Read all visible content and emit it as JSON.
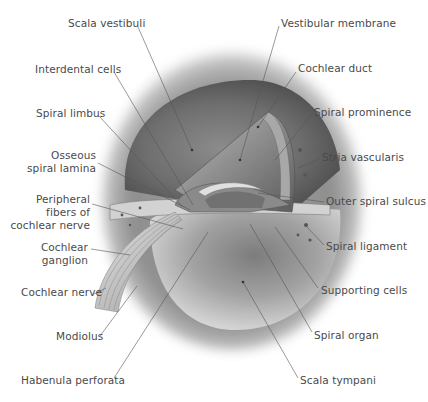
{
  "diagram": {
    "style": "grayscale anatomical illustration",
    "colors": {
      "background": "#ffffff",
      "text": "#4a4a4a",
      "leader_line": "#555555"
    },
    "labels_left": [
      {
        "id": "scala-vestibuli",
        "text": "Scala vestibuli"
      },
      {
        "id": "interdental-cells",
        "text": "Interdental cells"
      },
      {
        "id": "spiral-limbus",
        "text": "Spiral limbus"
      },
      {
        "id": "osseous-spiral-lamina",
        "lines": [
          "Osseous",
          "spiral lamina"
        ]
      },
      {
        "id": "peripheral-fibers",
        "lines": [
          "Peripheral",
          "fibers of",
          "cochlear nerve"
        ]
      },
      {
        "id": "cochlear-ganglion",
        "lines": [
          "Cochlear",
          "ganglion"
        ]
      },
      {
        "id": "cochlear-nerve",
        "text": "Cochlear nerve"
      },
      {
        "id": "modiolus",
        "text": "Modiolus"
      },
      {
        "id": "habenula-perforata",
        "text": "Habenula perforata"
      }
    ],
    "labels_right": [
      {
        "id": "vestibular-membrane",
        "text": "Vestibular membrane"
      },
      {
        "id": "cochlear-duct",
        "text": "Cochlear duct"
      },
      {
        "id": "spiral-prominence",
        "text": "Spiral prominence"
      },
      {
        "id": "stria-vascularis",
        "text": "Stria vascularis"
      },
      {
        "id": "outer-spiral-sulcus",
        "text": "Outer spiral sulcus"
      },
      {
        "id": "spiral-ligament",
        "text": "Spiral ligament"
      },
      {
        "id": "supporting-cells",
        "text": "Supporting cells"
      },
      {
        "id": "spiral-organ",
        "text": "Spiral organ"
      },
      {
        "id": "scala-tympani",
        "text": "Scala tympani"
      }
    ]
  }
}
